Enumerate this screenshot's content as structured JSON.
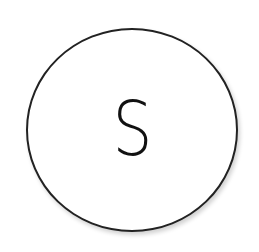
{
  "diagram": {
    "nodes": [
      {
        "id": "S",
        "shape": "circle",
        "label": "S",
        "border_color": "#222222",
        "fill_color": "#ffffff"
      }
    ]
  }
}
